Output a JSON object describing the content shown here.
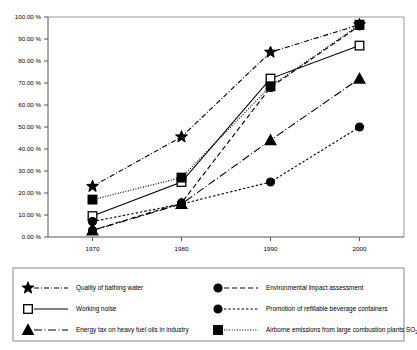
{
  "chart_data": {
    "type": "line",
    "title": "",
    "subtitle": "",
    "xlabel": "",
    "ylabel": "",
    "x": [
      1970,
      1980,
      1990,
      2000
    ],
    "categories": [
      "1970",
      "1980",
      "1990",
      "2000"
    ],
    "xtick_labels": [
      "1970",
      "1980",
      "1990",
      "2000"
    ],
    "ytick_labels": [
      "0.00 %",
      "10.00 %",
      "20.00 %",
      "30.00 %",
      "40.00 %",
      "50.00 %",
      "60.00 %",
      "70.00 %",
      "80.00 %",
      "90.00 %",
      "100.00 %"
    ],
    "ytick_values": [
      0,
      10,
      20,
      30,
      40,
      50,
      60,
      70,
      80,
      90,
      100
    ],
    "ylim": [
      0,
      100
    ],
    "xlim": [
      1965,
      2005
    ],
    "grid": false,
    "legend_position": "bottom",
    "series": [
      {
        "name": "Quality of bathing water",
        "marker": "star",
        "marker_fill": "filled",
        "line_style": "dash-dot",
        "values": [
          23,
          45.5,
          84,
          96.5
        ]
      },
      {
        "name": "Working noise",
        "marker": "square",
        "marker_fill": "open",
        "line_style": "solid",
        "values": [
          9.5,
          25,
          72,
          87
        ]
      },
      {
        "name": "Energy tax on heavy fuel oils in industry",
        "marker": "triangle",
        "marker_fill": "filled",
        "line_style": "dash-dot-long",
        "values": [
          3,
          15,
          44,
          72
        ]
      },
      {
        "name": "Environmental impact assessment",
        "marker": "circle",
        "marker_fill": "filled",
        "line_style": "dashed",
        "values": [
          3,
          15.5,
          68,
          96
        ]
      },
      {
        "name": "Promotion of refillable beverage containers",
        "marker": "circle",
        "marker_fill": "filled",
        "line_style": "dash-short",
        "values": [
          7,
          15,
          25,
          50
        ]
      },
      {
        "name": "Airborne emissions from large combustion plants SO2",
        "name_base": "Airborne emissions from large combustion plants SO",
        "name_sub": "2",
        "marker": "square",
        "marker_fill": "filled",
        "line_style": "dotted",
        "values": [
          17,
          27,
          68.5,
          96.5
        ]
      }
    ]
  },
  "legend": {
    "left_column": [
      {
        "label": "Quality of bathing water",
        "marker": "star-marker",
        "line": "dash-dot"
      },
      {
        "label": "Working noise",
        "marker": "open-square-marker",
        "line": "solid"
      },
      {
        "label": "Energy tax on heavy fuel oils in industry",
        "marker": "triangle-marker",
        "line": "dash-dot-long"
      }
    ],
    "right_column": [
      {
        "label": "Environmental impact assessment",
        "marker": "circle-marker",
        "line": "dashed"
      },
      {
        "label": "Promotion of refillable beverage containers",
        "marker": "circle-marker",
        "line": "dash-short"
      },
      {
        "label": "Airborne emissions from large combustion plants SO",
        "label_sub": "2",
        "marker": "filled-square-marker",
        "line": "dotted"
      }
    ]
  },
  "colors": {
    "line": "#000000",
    "axis": "#555555",
    "background": "#ffffff",
    "legend_border": "#888888"
  }
}
